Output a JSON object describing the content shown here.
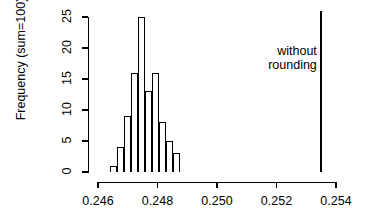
{
  "chart_data": {
    "type": "bar",
    "title": "",
    "subtitle": "",
    "xlabel": "",
    "ylabel": "Frequency (sum=100)",
    "xlim": [
      0.2456,
      0.2543
    ],
    "ylim": [
      0,
      26
    ],
    "grid": false,
    "legend": null,
    "xticks": [
      "0.246",
      "0.248",
      "0.250",
      "0.252",
      "0.254"
    ],
    "xtick_values": [
      0.246,
      0.248,
      0.25,
      0.252,
      0.254
    ],
    "yticks": [
      "0",
      "5",
      "10",
      "15",
      "20",
      "25"
    ],
    "ytick_values": [
      0,
      5,
      10,
      15,
      20,
      25
    ],
    "bin_width": 0.000235,
    "bins": [
      {
        "left": 0.2464,
        "right": 0.246635,
        "value": 1
      },
      {
        "left": 0.246635,
        "right": 0.24687,
        "value": 4
      },
      {
        "left": 0.24687,
        "right": 0.247105,
        "value": 9
      },
      {
        "left": 0.247105,
        "right": 0.24734,
        "value": 16
      },
      {
        "left": 0.24734,
        "right": 0.247575,
        "value": 25
      },
      {
        "left": 0.247575,
        "right": 0.24781,
        "value": 13
      },
      {
        "left": 0.24781,
        "right": 0.248045,
        "value": 16
      },
      {
        "left": 0.248045,
        "right": 0.24828,
        "value": 8
      },
      {
        "left": 0.24828,
        "right": 0.248515,
        "value": 5
      },
      {
        "left": 0.248515,
        "right": 0.24875,
        "value": 3
      }
    ],
    "values": [
      1,
      4,
      9,
      16,
      25,
      13,
      16,
      8,
      5,
      3
    ],
    "categories": [
      "0.24640",
      "0.24664",
      "0.24687",
      "0.24711",
      "0.24734",
      "0.24758",
      "0.24781",
      "0.24805",
      "0.24828",
      "0.24852"
    ],
    "annotations": [
      {
        "name": "without-rounding-line",
        "type": "vline",
        "x": 0.25349,
        "label": "without rounding",
        "label_line1": "without",
        "label_line2": "rounding",
        "label_position": "left-of-line",
        "y_top": 26,
        "y_bottom": 0
      }
    ],
    "colors": {
      "axis": "#000000",
      "bar_edge": "#000000",
      "bar_fill": "transparent",
      "annotation_line": "#000000",
      "background": "#ffffff"
    }
  }
}
